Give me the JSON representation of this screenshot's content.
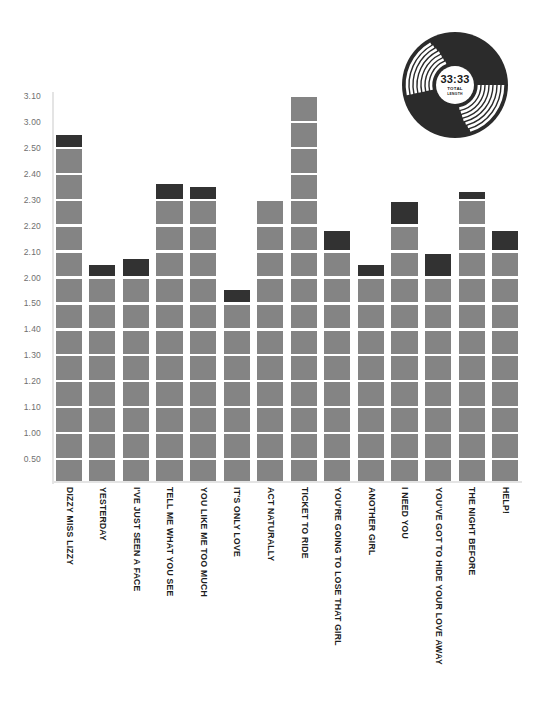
{
  "badge": {
    "name": "vinyl-record-badge",
    "total_time": "33:33",
    "total_word": "TOTAL",
    "length_word": "LENGTH"
  },
  "colors": {
    "bar_fill": "#848484",
    "bar_cap": "#323232",
    "grid_line": "#ffffff",
    "axis_line": "#e4e4e4",
    "y_label": "#6f6f6f",
    "x_label": "#1c1c1c",
    "background": "#ffffff"
  },
  "chart_data": {
    "type": "bar",
    "title": "",
    "subtitle": "",
    "xlabel": "",
    "ylabel": "",
    "grid": true,
    "legend": "none",
    "orientation": "vertical",
    "value_format": "m.ss (minutes.seconds)",
    "ytick_labels": [
      "0.50",
      "1.00",
      "1.10",
      "1.20",
      "1.30",
      "1.40",
      "1.50",
      "2.00",
      "2.10",
      "2.20",
      "2.30",
      "2.40",
      "2.50",
      "3.00",
      "3.10"
    ],
    "ytick_seconds": [
      50,
      60,
      70,
      80,
      90,
      100,
      110,
      120,
      130,
      140,
      150,
      160,
      170,
      180,
      190
    ],
    "ylim_seconds": [
      40,
      190
    ],
    "categories": [
      "DIZZY MISS LIZZY",
      "YESTERDAY",
      "I'VE JUST SEEN A FACE",
      "TELL ME WHAT YOU SEE",
      "YOU LIKE ME TOO MUCH",
      "IT'S ONLY LOVE",
      "ACT NATURALLY",
      "TICKET TO RIDE",
      "YOU'RE GOING TO LOSE THAT GIRL",
      "ANOTHER GIRL",
      "I NEED YOU",
      "YOU'VE GOT TO HIDE YOUR LOVE AWAY",
      "THE NIGHT BEFORE",
      "HELP!"
    ],
    "values": [
      "2.55",
      "2.05",
      "2.07",
      "2.36",
      "2.35",
      "1.55",
      "2.30",
      "3.10",
      "2.18",
      "2.05",
      "2.29",
      "2.09",
      "2.33",
      "2.18"
    ],
    "values_seconds": [
      175,
      125,
      127,
      156,
      155,
      115,
      150,
      190,
      138,
      125,
      149,
      129,
      153,
      138
    ]
  }
}
